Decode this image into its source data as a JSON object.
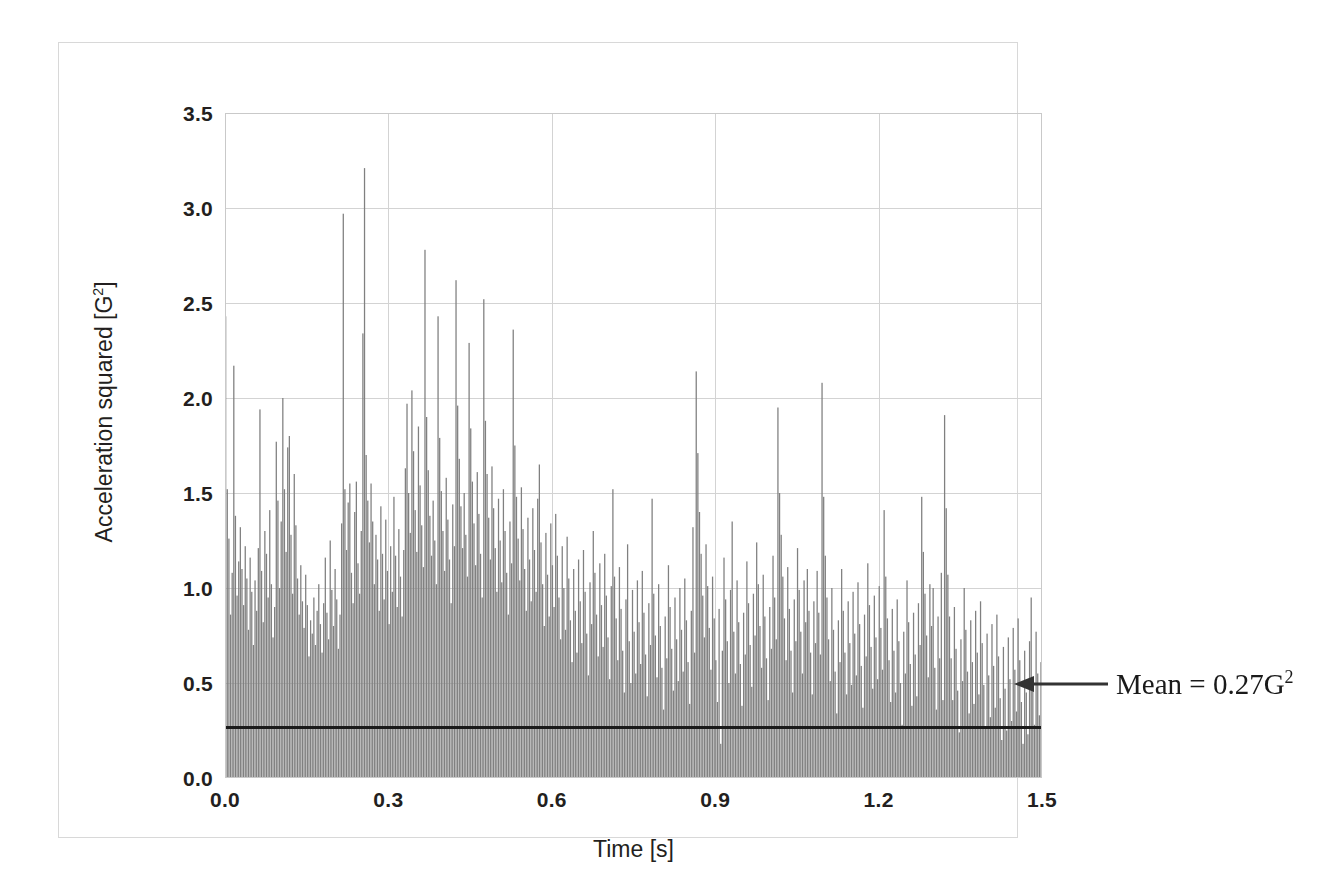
{
  "figure": {
    "background_color": "#ffffff",
    "frame_color": "#d8d8d8"
  },
  "annotation": {
    "mean_label_prefix": "Mean = 0.27G",
    "mean_label_exponent": "2",
    "arrow_icon": "arrow-left-icon",
    "arrow_color": "#333333"
  },
  "axes": {
    "y_title_prefix": "Acceleration squared [G",
    "y_title_exponent": "2",
    "y_title_suffix": "]",
    "x_title": "Time [s]",
    "y_ticks": [
      "3.5",
      "3.0",
      "2.5",
      "2.0",
      "1.5",
      "1.0",
      "0.5",
      "0.0"
    ],
    "x_ticks": [
      "0.0",
      "0.3",
      "0.6",
      "0.9",
      "1.2",
      "1.5"
    ]
  },
  "chart_data": {
    "type": "bar",
    "title": "",
    "subtitle": "",
    "xlabel": "Time [s]",
    "ylabel": "Acceleration squared [G^2]",
    "xlim": [
      0.0,
      1.5
    ],
    "ylim": [
      0.0,
      3.5
    ],
    "yticks": [
      0.0,
      0.5,
      1.0,
      1.5,
      2.0,
      2.5,
      3.0,
      3.5
    ],
    "xticks": [
      0.0,
      0.3,
      0.6,
      0.9,
      1.2,
      1.5
    ],
    "grid": true,
    "legend": null,
    "bar_color": "#808080",
    "bar_edge_color": "#808080",
    "annotations": [
      {
        "type": "hline",
        "label": "Mean = 0.27G^2",
        "value": 0.27,
        "color": "#1a1a1a"
      }
    ],
    "x_sample_interval": 0.003,
    "n_points": 500,
    "values": [
      2.43,
      1.52,
      1.26,
      0.86,
      1.08,
      2.17,
      1.38,
      0.96,
      1.14,
      1.32,
      1.1,
      0.91,
      1.22,
      1.05,
      0.78,
      1.16,
      0.98,
      0.7,
      1.04,
      0.88,
      1.21,
      1.94,
      1.09,
      0.82,
      1.3,
      1.18,
      0.95,
      1.41,
      1.02,
      0.74,
      0.9,
      1.77,
      1.46,
      1.0,
      1.35,
      2.0,
      1.52,
      1.19,
      1.74,
      1.8,
      1.28,
      0.97,
      1.6,
      1.33,
      1.05,
      0.86,
      1.12,
      0.93,
      0.79,
      1.07,
      0.91,
      0.64,
      0.83,
      0.76,
      0.95,
      0.7,
      0.88,
      1.02,
      0.81,
      0.66,
      0.92,
      1.16,
      0.87,
      0.73,
      1.25,
      0.99,
      0.8,
      1.1,
      0.94,
      0.68,
      0.86,
      1.34,
      2.97,
      1.52,
      1.2,
      1.45,
      1.55,
      1.08,
      0.92,
      1.4,
      1.56,
      1.13,
      0.97,
      1.3,
      2.34,
      3.21,
      1.7,
      1.46,
      1.24,
      1.55,
      1.35,
      1.02,
      1.28,
      1.15,
      0.88,
      1.43,
      1.18,
      0.94,
      1.36,
      1.09,
      0.81,
      1.22,
      0.98,
      1.48,
      1.17,
      0.9,
      1.31,
      1.06,
      0.85,
      1.2,
      1.63,
      1.97,
      1.5,
      1.29,
      2.04,
      1.72,
      1.41,
      1.19,
      1.85,
      1.54,
      1.33,
      1.11,
      2.78,
      1.9,
      1.62,
      1.38,
      1.17,
      1.46,
      1.25,
      1.02,
      2.43,
      1.79,
      1.51,
      1.3,
      1.09,
      1.58,
      1.36,
      1.15,
      0.92,
      1.44,
      1.22,
      2.62,
      1.96,
      1.68,
      1.43,
      1.21,
      1.5,
      1.28,
      1.06,
      2.29,
      1.84,
      1.56,
      1.34,
      1.12,
      1.61,
      1.39,
      1.18,
      0.95,
      2.52,
      1.88,
      1.6,
      1.37,
      1.15,
      1.64,
      1.42,
      1.21,
      0.98,
      1.47,
      1.25,
      1.03,
      1.52,
      1.3,
      1.08,
      0.86,
      1.35,
      1.13,
      2.36,
      1.75,
      1.48,
      1.26,
      1.04,
      1.53,
      1.31,
      1.1,
      0.88,
      1.37,
      1.15,
      0.93,
      1.42,
      1.2,
      0.98,
      1.47,
      1.65,
      1.24,
      1.02,
      0.8,
      1.29,
      1.07,
      0.85,
      1.34,
      1.12,
      0.9,
      1.39,
      1.17,
      0.95,
      0.73,
      1.22,
      1.0,
      0.78,
      1.27,
      1.05,
      0.83,
      0.61,
      1.1,
      0.88,
      0.66,
      1.15,
      0.93,
      0.71,
      1.2,
      0.98,
      0.76,
      0.54,
      1.03,
      0.81,
      1.3,
      1.08,
      0.86,
      0.64,
      1.13,
      0.91,
      0.69,
      1.18,
      0.96,
      0.74,
      0.52,
      1.01,
      1.52,
      1.06,
      0.84,
      0.62,
      1.11,
      0.89,
      0.67,
      0.45,
      0.94,
      1.23,
      0.72,
      0.5,
      0.99,
      0.77,
      0.55,
      1.04,
      0.82,
      0.6,
      1.09,
      0.87,
      0.65,
      0.43,
      0.92,
      0.7,
      1.47,
      0.97,
      0.75,
      0.53,
      1.02,
      0.8,
      0.58,
      0.36,
      0.85,
      0.63,
      1.12,
      0.9,
      0.68,
      0.46,
      0.95,
      0.73,
      0.51,
      1.0,
      0.78,
      0.56,
      1.05,
      0.83,
      0.61,
      0.39,
      0.88,
      1.32,
      0.66,
      2.14,
      1.71,
      1.4,
      1.18,
      0.96,
      0.74,
      1.23,
      1.01,
      0.79,
      0.57,
      1.06,
      0.84,
      0.62,
      0.4,
      0.89,
      0.18,
      0.67,
      1.16,
      0.94,
      0.72,
      0.5,
      0.99,
      1.35,
      0.77,
      0.55,
      1.04,
      0.82,
      0.6,
      0.38,
      0.87,
      0.65,
      1.14,
      0.92,
      0.7,
      0.48,
      0.97,
      0.75,
      1.24,
      1.02,
      0.8,
      0.58,
      1.07,
      0.85,
      0.63,
      0.41,
      0.9,
      0.68,
      1.17,
      0.95,
      0.73,
      1.95,
      1.5,
      1.28,
      1.06,
      0.84,
      0.62,
      1.11,
      0.89,
      0.67,
      0.45,
      0.94,
      0.72,
      1.21,
      0.99,
      0.77,
      0.55,
      1.04,
      0.82,
      1.1,
      0.88,
      0.66,
      0.44,
      0.93,
      0.71,
      1.09,
      0.87,
      0.65,
      2.08,
      1.48,
      1.17,
      0.95,
      0.73,
      0.51,
      1.0,
      0.78,
      0.56,
      0.34,
      0.83,
      0.61,
      1.1,
      0.88,
      0.66,
      0.44,
      0.93,
      0.71,
      0.49,
      0.98,
      0.76,
      0.54,
      1.03,
      0.81,
      0.59,
      0.37,
      0.86,
      0.64,
      1.13,
      0.91,
      0.69,
      0.47,
      0.96,
      0.74,
      0.52,
      1.01,
      0.79,
      0.57,
      1.41,
      1.06,
      0.84,
      0.62,
      0.4,
      0.89,
      0.67,
      0.45,
      0.94,
      0.72,
      0.5,
      0.28,
      0.77,
      0.55,
      1.04,
      0.82,
      0.6,
      0.38,
      0.87,
      0.65,
      0.43,
      0.92,
      0.7,
      1.48,
      1.19,
      0.97,
      0.75,
      0.53,
      1.02,
      0.8,
      1.0,
      0.58,
      0.36,
      0.85,
      0.63,
      1.08,
      0.41,
      1.91,
      1.42,
      1.07,
      0.85,
      0.63,
      0.41,
      0.9,
      0.68,
      0.46,
      0.24,
      0.73,
      0.51,
      1.0,
      0.78,
      0.56,
      0.34,
      0.83,
      0.61,
      0.39,
      0.88,
      0.66,
      0.44,
      0.93,
      0.71,
      0.49,
      0.27,
      0.76,
      0.54,
      0.32,
      0.81,
      0.59,
      0.37,
      0.86,
      0.64,
      0.42,
      0.2,
      0.69,
      0.47,
      0.25,
      0.74,
      0.52,
      0.3,
      0.79,
      0.57,
      0.35,
      0.84,
      0.62,
      0.4,
      0.18,
      0.67,
      0.45,
      0.23,
      0.72,
      0.95,
      0.5,
      0.28,
      0.77,
      0.55,
      0.33,
      0.61
    ]
  }
}
